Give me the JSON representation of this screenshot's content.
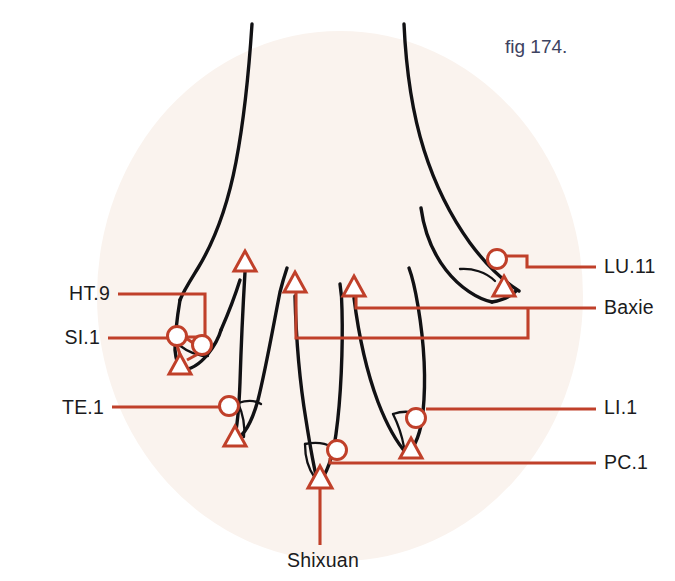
{
  "figure": {
    "caption": "fig 174.",
    "caption_color": "#3d4260",
    "top_partial_text": "",
    "background_oval_color": "#faf3ee",
    "leader_color": "#c0402a",
    "outline_color": "#111114",
    "marker_fill": "#ffffff"
  },
  "labels": {
    "left": [
      {
        "id": "ht9",
        "text": "HT.9",
        "x": 110,
        "y": 300
      },
      {
        "id": "si1",
        "text": "SI.1",
        "x": 100,
        "y": 344
      },
      {
        "id": "te1",
        "text": "TE.1",
        "x": 104,
        "y": 414
      }
    ],
    "right": [
      {
        "id": "lu11",
        "text": "LU.11",
        "x": 604,
        "y": 273
      },
      {
        "id": "baxie",
        "text": "Baxie",
        "x": 604,
        "y": 314
      },
      {
        "id": "li1",
        "text": "LI.1",
        "x": 604,
        "y": 414
      },
      {
        "id": "pc1",
        "text": "PC.1",
        "x": 604,
        "y": 469
      }
    ],
    "bottom": [
      {
        "id": "shixuan",
        "text": "Shixuan",
        "x": 323,
        "y": 567
      }
    ]
  },
  "point_markers": [
    {
      "id": "ht9-circle",
      "type": "circle",
      "cx": 177,
      "cy": 336,
      "r": 9.5,
      "point": "HT.9"
    },
    {
      "id": "si1-circle",
      "type": "circle",
      "cx": 202,
      "cy": 345,
      "r": 9.5,
      "point": "SI.1"
    },
    {
      "id": "little-tip-tri",
      "type": "triangle",
      "cx": 180,
      "cy": 365,
      "size": 11,
      "point": "Shixuan-little"
    },
    {
      "id": "ring-baxie-tri",
      "type": "triangle",
      "cx": 245,
      "cy": 262,
      "size": 11,
      "point": "Baxie-ring"
    },
    {
      "id": "te1-circle",
      "type": "circle",
      "cx": 229,
      "cy": 406,
      "r": 9.5,
      "point": "TE.1"
    },
    {
      "id": "ring-nail-tri",
      "type": "triangle",
      "cx": 235,
      "cy": 437,
      "size": 11,
      "point": "Shixuan-ring"
    },
    {
      "id": "middle-baxie-tri",
      "type": "triangle",
      "cx": 295,
      "cy": 283,
      "size": 11,
      "point": "Baxie-middle"
    },
    {
      "id": "pc1-circle",
      "type": "circle",
      "cx": 337,
      "cy": 450,
      "r": 9.5,
      "point": "PC.1"
    },
    {
      "id": "shixuan-tri",
      "type": "triangle",
      "cx": 320,
      "cy": 479,
      "size": 12,
      "point": "Shixuan"
    },
    {
      "id": "index-baxie-tri",
      "type": "triangle",
      "cx": 354,
      "cy": 287,
      "size": 11,
      "point": "Baxie-index"
    },
    {
      "id": "li1-circle",
      "type": "circle",
      "cx": 416,
      "cy": 418,
      "r": 9.5,
      "point": "LI.1"
    },
    {
      "id": "index-nail-tri",
      "type": "triangle",
      "cx": 411,
      "cy": 449,
      "size": 11,
      "point": "Shixuan-index"
    },
    {
      "id": "lu11-circle",
      "type": "circle",
      "cx": 497,
      "cy": 259,
      "r": 9.5,
      "point": "LU.11"
    },
    {
      "id": "thumb-nail-tri",
      "type": "triangle",
      "cx": 504,
      "cy": 287,
      "size": 11,
      "point": "Shixuan-thumb"
    }
  ],
  "leader_lines": [
    {
      "id": "ht9-leader",
      "label": "HT.9",
      "path": "M 118 294 L 205 294 L 205 337 L 186 337"
    },
    {
      "id": "si1-leader",
      "label": "SI.1",
      "path": "M 108 338 L 168 338"
    },
    {
      "id": "te1-leader",
      "label": "TE.1",
      "path": "M 112 407 L 220 407"
    },
    {
      "id": "lu11-leader",
      "label": "LU.11",
      "path": "M 596 267 L 527 267 L 527 256 L 506 256"
    },
    {
      "id": "baxie-leader",
      "label": "Baxie",
      "path": "M 596 308 L 356 308 L 356 289"
    },
    {
      "id": "baxie-branch",
      "label": "Baxie",
      "path": "M 528 308 L 528 338 L 296 338 L 296 288"
    },
    {
      "id": "li1-leader",
      "label": "LI.1",
      "path": "M 596 409 L 426 409"
    },
    {
      "id": "pc1-leader",
      "label": "PC.1",
      "path": "M 596 463 L 330 463 L 330 458"
    },
    {
      "id": "shixuan-leader",
      "label": "Shixuan",
      "path": "M 320 545 L 320 488"
    }
  ],
  "hand_outline": {
    "description": "dorsal view of hand with five digits, thumb at right",
    "parts": [
      "wrist-left-edge",
      "wrist-right-edge",
      "thumb",
      "index-finger",
      "middle-finger",
      "ring-finger",
      "little-finger",
      "nail-beds"
    ]
  }
}
